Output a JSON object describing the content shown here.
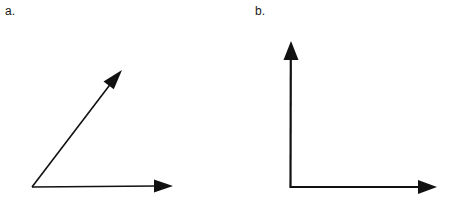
{
  "page": {
    "width": 454,
    "height": 209,
    "background_color": "#ffffff",
    "ink_color": "#111111"
  },
  "figures": [
    {
      "id": "figure-a",
      "label": "a.",
      "label_position": {
        "x": 5,
        "y": 5
      },
      "kind": "acute-angle",
      "vertex": {
        "x": 32,
        "y": 187
      },
      "rays": [
        {
          "name": "horizontal-ray",
          "from": {
            "x": 32,
            "y": 187
          },
          "tip": {
            "x": 173,
            "y": 186
          },
          "arrow": true,
          "stroke_width": 1.4
        },
        {
          "name": "diagonal-ray",
          "from": {
            "x": 32,
            "y": 187
          },
          "tip": {
            "x": 122,
            "y": 70
          },
          "arrow": true,
          "stroke_width": 1.6
        }
      ]
    },
    {
      "id": "figure-b",
      "label": "b.",
      "label_position": {
        "x": 255,
        "y": 5
      },
      "kind": "right-angle",
      "vertex": {
        "x": 290,
        "y": 188
      },
      "rays": [
        {
          "name": "vertical-ray",
          "from": {
            "x": 290,
            "y": 188
          },
          "tip": {
            "x": 291,
            "y": 41
          },
          "arrow": true,
          "stroke_width": 2.2
        },
        {
          "name": "horizontal-ray",
          "from": {
            "x": 290,
            "y": 188
          },
          "tip": {
            "x": 437,
            "y": 187
          },
          "arrow": true,
          "stroke_width": 2.0
        }
      ]
    }
  ]
}
